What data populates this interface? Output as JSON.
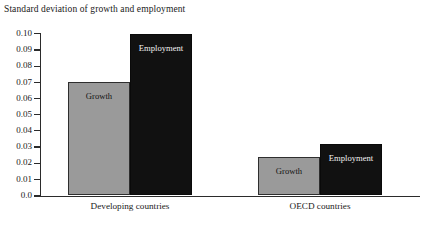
{
  "chart_data": {
    "type": "bar",
    "title": "Standard deviation of growth and employment",
    "xlabel": "",
    "ylabel": "",
    "ylim": [
      0.0,
      0.1
    ],
    "grid": false,
    "legend_position": "in-bar labels",
    "categories": [
      "Developing countries",
      "OECD countries"
    ],
    "ytick_labels": [
      "0.10",
      "0.09",
      "0.08",
      "0.07",
      "0.06",
      "0.05",
      "0.04",
      "0.03",
      "0.02",
      "0.01",
      "0.0"
    ],
    "ytick_values": [
      0.1,
      0.09,
      0.08,
      0.07,
      0.06,
      0.05,
      0.04,
      0.03,
      0.02,
      0.01,
      0.0
    ],
    "series": [
      {
        "name": "Growth",
        "color": "#9a9a9a",
        "values": [
          0.07,
          0.024
        ]
      },
      {
        "name": "Employment",
        "color": "#111111",
        "values": [
          0.1,
          0.032
        ]
      }
    ],
    "bar_labels": [
      {
        "text": "Growth",
        "group": "Developing countries"
      },
      {
        "text": "Employment",
        "group": "Developing countries"
      },
      {
        "text": "Growth",
        "group": "OECD countries"
      },
      {
        "text": "Employment",
        "group": "OECD countries"
      }
    ]
  }
}
